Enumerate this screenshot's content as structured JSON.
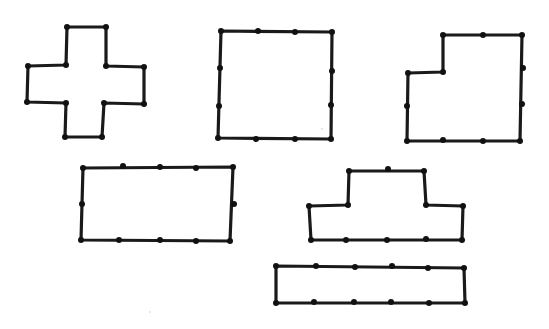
{
  "figure": {
    "background": "#ffffff",
    "stroke_color": "#1a1a1a",
    "dot_color": "#111111",
    "shapes": [
      {
        "name": "cross-pentomino",
        "points": [
          [
            67,
            27
          ],
          [
            106,
            27
          ],
          [
            106,
            66
          ],
          [
            144,
            67
          ],
          [
            144,
            104
          ],
          [
            104,
            103
          ],
          [
            102,
            137
          ],
          [
            65,
            137
          ],
          [
            66,
            103
          ],
          [
            27,
            102
          ],
          [
            28,
            66
          ],
          [
            66,
            65
          ]
        ],
        "dots": [
          [
            67,
            27
          ],
          [
            106,
            27
          ],
          [
            106,
            66
          ],
          [
            144,
            67
          ],
          [
            144,
            104
          ],
          [
            104,
            103
          ],
          [
            102,
            137
          ],
          [
            65,
            137
          ],
          [
            66,
            103
          ],
          [
            27,
            102
          ],
          [
            28,
            66
          ],
          [
            66,
            65
          ]
        ]
      },
      {
        "name": "square",
        "points": [
          [
            221,
            31
          ],
          [
            332,
            32
          ],
          [
            331,
            139
          ],
          [
            218,
            138
          ]
        ],
        "dots": [
          [
            221,
            31
          ],
          [
            258,
            31
          ],
          [
            295,
            32
          ],
          [
            332,
            32
          ],
          [
            332,
            71
          ],
          [
            331,
            105
          ],
          [
            331,
            139
          ],
          [
            295,
            139
          ],
          [
            256,
            139
          ],
          [
            218,
            138
          ],
          [
            219,
            106
          ],
          [
            220,
            68
          ]
        ]
      },
      {
        "name": "l-shape",
        "points": [
          [
            443,
            35
          ],
          [
            522,
            35
          ],
          [
            520,
            141
          ],
          [
            407,
            141
          ],
          [
            408,
            73
          ],
          [
            443,
            72
          ]
        ],
        "dots": [
          [
            443,
            35
          ],
          [
            483,
            35
          ],
          [
            522,
            35
          ],
          [
            523,
            68
          ],
          [
            522,
            104
          ],
          [
            520,
            141
          ],
          [
            483,
            141
          ],
          [
            443,
            140
          ],
          [
            407,
            141
          ],
          [
            407,
            106
          ],
          [
            408,
            73
          ],
          [
            443,
            72
          ]
        ]
      },
      {
        "name": "rectangle",
        "points": [
          [
            83,
            168
          ],
          [
            233,
            167
          ],
          [
            230,
            241
          ],
          [
            81,
            240
          ]
        ],
        "dots": [
          [
            83,
            168
          ],
          [
            123,
            166
          ],
          [
            160,
            167
          ],
          [
            196,
            168
          ],
          [
            233,
            167
          ],
          [
            234,
            204
          ],
          [
            230,
            241
          ],
          [
            196,
            241
          ],
          [
            160,
            240
          ],
          [
            119,
            240
          ],
          [
            81,
            240
          ],
          [
            82,
            204
          ]
        ]
      },
      {
        "name": "t-shape",
        "points": [
          [
            349,
            171
          ],
          [
            424,
            171
          ],
          [
            426,
            205
          ],
          [
            463,
            206
          ],
          [
            462,
            240
          ],
          [
            311,
            240
          ],
          [
            309,
            206
          ],
          [
            348,
            205
          ]
        ],
        "dots": [
          [
            349,
            171
          ],
          [
            388,
            169
          ],
          [
            424,
            171
          ],
          [
            426,
            205
          ],
          [
            463,
            206
          ],
          [
            462,
            240
          ],
          [
            426,
            239
          ],
          [
            387,
            240
          ],
          [
            346,
            240
          ],
          [
            311,
            240
          ],
          [
            309,
            206
          ],
          [
            348,
            205
          ]
        ]
      },
      {
        "name": "long-bar",
        "points": [
          [
            276,
            266
          ],
          [
            464,
            268
          ],
          [
            465,
            303
          ],
          [
            276,
            303
          ]
        ],
        "dots": [
          [
            276,
            266
          ],
          [
            316,
            266
          ],
          [
            355,
            267
          ],
          [
            392,
            266
          ],
          [
            428,
            268
          ],
          [
            464,
            268
          ],
          [
            465,
            303
          ],
          [
            429,
            303
          ],
          [
            391,
            302
          ],
          [
            354,
            302
          ],
          [
            314,
            302
          ],
          [
            276,
            303
          ]
        ]
      }
    ],
    "specks": [
      [
        322,
        129
      ],
      [
        150,
        312
      ]
    ]
  }
}
